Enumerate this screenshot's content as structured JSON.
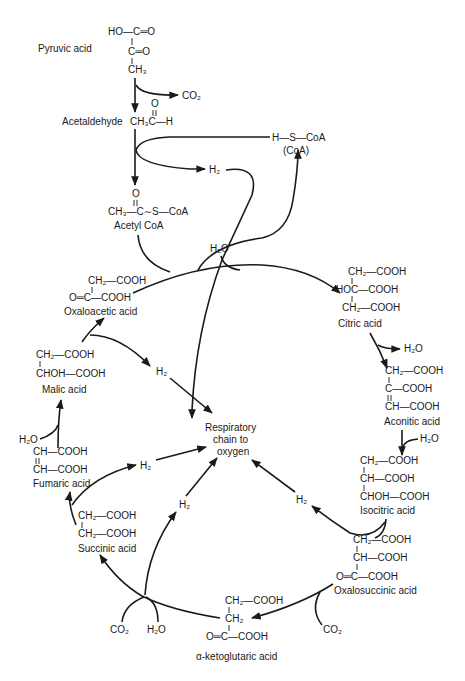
{
  "compounds": {
    "pyruvic": {
      "name": "Pyruvic acid",
      "lines": [
        "HO—C═O",
        "C═O",
        "CH₃"
      ]
    },
    "acetaldehyde": {
      "name": "Acetaldehyde",
      "formula": "CH₃C—H",
      "carbonyl": "O"
    },
    "acetyl_coa": {
      "name": "Acetyl CoA",
      "formula": "CH₃—C∼S—CoA",
      "carbonyl": "O"
    },
    "coa": {
      "formula": "H—S—CoA",
      "name": "(CoA)"
    },
    "oxaloacetic": {
      "name": "Oxaloacetic acid",
      "lines": [
        "CH₂—COOH",
        "O═C—COOH"
      ]
    },
    "citric": {
      "name": "Citric acid",
      "lines": [
        "CH₂—COOH",
        "HOC—COOH",
        "CH₂—COOH"
      ]
    },
    "aconitic": {
      "name": "Aconitic acid",
      "lines": [
        "CH₂—COOH",
        "C—COOH",
        "CH—COOH"
      ]
    },
    "isocitric": {
      "name": "Isocitric acid",
      "lines": [
        "CH₂—COOH",
        "CH—COOH",
        "CHOH—COOH"
      ]
    },
    "oxalosuccinic": {
      "name": "Oxalosuccinic acid",
      "lines": [
        "CH₂—COOH",
        "CH—COOH",
        "O═C—COOH"
      ]
    },
    "ketoglutaric": {
      "name": "α-ketoglutaric acid",
      "lines": [
        "CH₂—COOH",
        "CH₂",
        "O═C—COOH"
      ]
    },
    "succinic": {
      "name": "Succinic acid",
      "lines": [
        "CH₂—COOH",
        "CH₂—COOH"
      ]
    },
    "fumaric": {
      "name": "Fumaric acid",
      "lines": [
        "CH—COOH",
        "CH—COOH"
      ]
    },
    "malic": {
      "name": "Malic acid",
      "lines": [
        "CH₂—COOH",
        "CHOH—COOH"
      ]
    }
  },
  "byproducts": {
    "co2": "CO₂",
    "h2o": "H₂O",
    "h2": "H₂"
  },
  "respiratory_chain": {
    "lines": [
      "Respiratory",
      "chain to",
      "oxygen"
    ]
  },
  "colors": {
    "ink": "#1a1a1a",
    "background": "#ffffff"
  }
}
